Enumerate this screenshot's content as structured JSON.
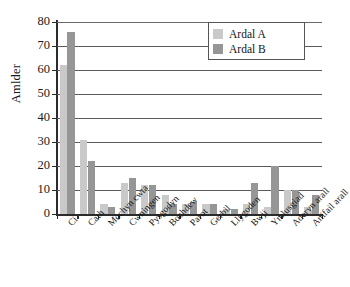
{
  "chart_data": {
    "type": "bar",
    "title": "",
    "xlabel": "",
    "ylabel": "Amlder",
    "ylim": [
      0,
      80
    ],
    "ytick_step": 10,
    "ytick_labels": [
      "0",
      "10",
      "20",
      "30",
      "40",
      "50",
      "60",
      "70",
      "80"
    ],
    "grid": true,
    "grid_axis": "y",
    "legend_position": "top-right",
    "categories": [
      "Ci",
      "Cath",
      "Mochyn cwta",
      "Cwningen",
      "Pysgodyn",
      "Bochdew",
      "Parot",
      "Gerbil",
      "Llygoden",
      "Bwji",
      "Ymlusgiad",
      "Aderyn arall",
      "Anifail arall"
    ],
    "series": [
      {
        "name": "Ardal A",
        "color": "#c9c9c9",
        "values": [
          62,
          31,
          4,
          13,
          12,
          8,
          4,
          4,
          2,
          4,
          3,
          10,
          3
        ]
      },
      {
        "name": "Ardal B",
        "color": "#969696",
        "values": [
          76,
          22,
          3,
          15,
          12,
          4,
          5,
          4,
          2,
          13,
          20,
          10,
          8
        ]
      }
    ]
  },
  "legend": {
    "entries": [
      {
        "label": "Ardal A"
      },
      {
        "label": "Ardal B"
      }
    ]
  },
  "axis": {
    "y_title": "Amlder"
  }
}
